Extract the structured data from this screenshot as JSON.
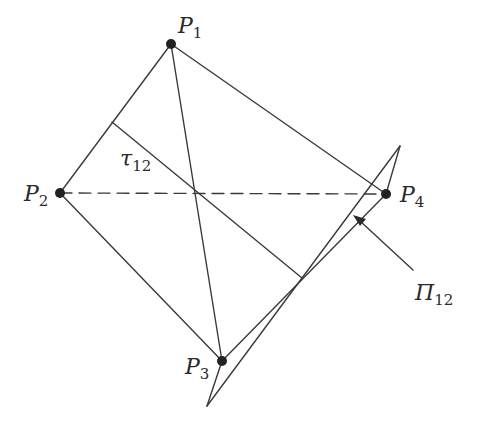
{
  "figure": {
    "type": "geometric-diagram",
    "stroke_color": "#3a3a3a",
    "points": [
      {
        "id": "P1",
        "label": "P",
        "sub": "1",
        "x": 171,
        "y": 44
      },
      {
        "id": "P2",
        "label": "P",
        "sub": "2",
        "x": 60,
        "y": 193
      },
      {
        "id": "P3",
        "label": "P",
        "sub": "3",
        "x": 222,
        "y": 361
      },
      {
        "id": "P4",
        "label": "P",
        "sub": "4",
        "x": 386,
        "y": 194
      }
    ],
    "segments": [
      {
        "from": "P1",
        "to": "P2",
        "style": "solid"
      },
      {
        "from": "P1",
        "to": "P4",
        "style": "solid"
      },
      {
        "from": "P1",
        "to": "P3",
        "style": "solid"
      },
      {
        "from": "P2",
        "to": "P3",
        "style": "solid"
      },
      {
        "from": "P2",
        "to": "P4",
        "style": "dashed"
      }
    ],
    "tau": {
      "label": "τ",
      "sub": "12"
    },
    "plane": {
      "label": "Π",
      "sub": "12"
    }
  }
}
